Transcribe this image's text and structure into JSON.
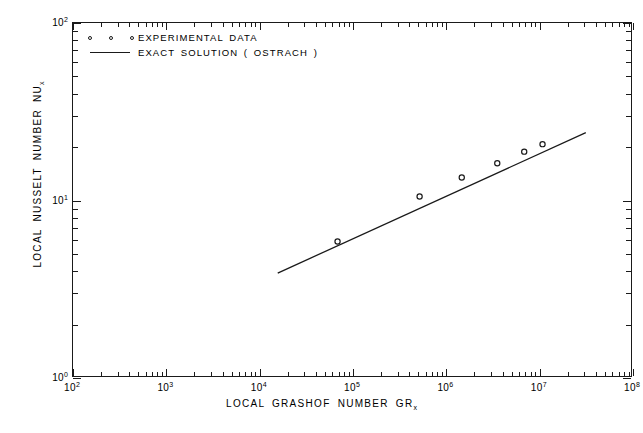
{
  "chart_data": {
    "type": "scatter",
    "title": "",
    "xlabel": "LOCAL GRASHOF NUMBER GR",
    "xlabel_sub": "x",
    "ylabel": "LOCAL NUSSELT NUMBER NU",
    "ylabel_sub": "x",
    "xscale": "log",
    "yscale": "log",
    "xlim": [
      100,
      100000000
    ],
    "ylim": [
      1,
      100
    ],
    "grid": false,
    "legend_position": "top-left",
    "x_tick_labels": [
      "10",
      "10",
      "10",
      "10",
      "10",
      "10",
      "10"
    ],
    "x_tick_exponents": [
      "2",
      "3",
      "4",
      "5",
      "6",
      "7",
      "8"
    ],
    "x_tick_values": [
      100,
      1000,
      10000,
      100000,
      1000000,
      10000000,
      100000000
    ],
    "y_tick_labels": [
      "10",
      "10",
      "10"
    ],
    "y_tick_exponents": [
      "0",
      "1",
      "2"
    ],
    "y_tick_values": [
      1,
      10,
      100
    ],
    "series": [
      {
        "name": "EXPERIMENTAL DATA",
        "type": "scatter",
        "marker": "open-circle",
        "color": "#1a1a1a",
        "points": [
          {
            "x": 70000,
            "y": 5.8
          },
          {
            "x": 530000,
            "y": 10.4
          },
          {
            "x": 1500000,
            "y": 13.3
          },
          {
            "x": 3600000,
            "y": 16.0
          },
          {
            "x": 7000000,
            "y": 18.6
          },
          {
            "x": 11000000,
            "y": 20.5
          }
        ]
      },
      {
        "name": "EXACT SOLUTION ( OSTRACH )",
        "type": "line",
        "color": "#1a1a1a",
        "endpoints": [
          {
            "x": 16000,
            "y": 3.85
          },
          {
            "x": 32000000,
            "y": 23.8
          }
        ]
      }
    ]
  },
  "legend": {
    "entries": [
      {
        "label": "EXPERIMENTAL DATA",
        "key": "markers"
      },
      {
        "label": "EXACT SOLUTION ( OSTRACH )",
        "key": "line"
      }
    ]
  },
  "axes": {
    "x_title": "LOCAL GRASHOF NUMBER GR",
    "x_title_sub": "x",
    "y_title": "LOCAL NUSSELT NUMBER NU",
    "y_title_sub": "x"
  }
}
